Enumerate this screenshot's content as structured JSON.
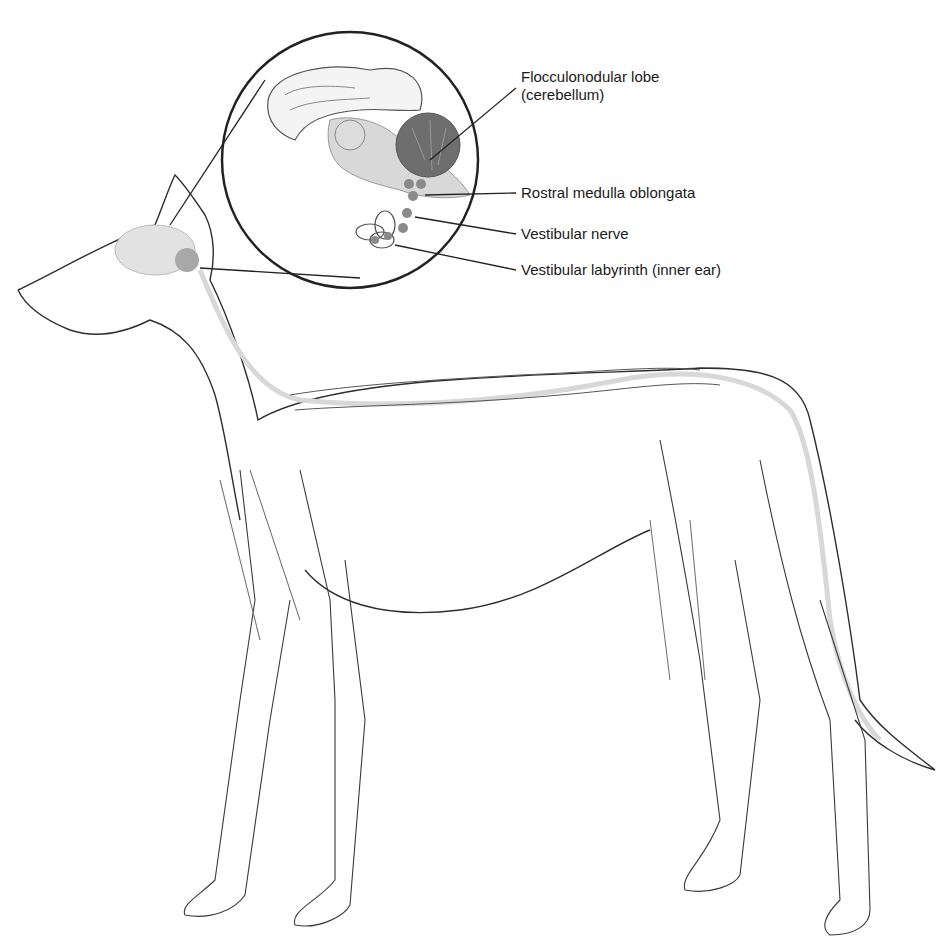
{
  "figure": {
    "inset": {
      "shape": "circle",
      "content": "brain-sagittal-section-with-inner-ear"
    },
    "colors": {
      "outline": "#2a2a2a",
      "nervous_tissue": "#d6d6d6",
      "highlight": "#8a8a8a",
      "cerebellum": "#707070"
    }
  },
  "labels": [
    {
      "id": "flocculonodular",
      "line1": "Flocculonodular lobe",
      "line2": "(cerebellum)"
    },
    {
      "id": "rostral-medulla",
      "line1": "Rostral medulla oblongata"
    },
    {
      "id": "vestibular-nerve",
      "line1": "Vestibular nerve"
    },
    {
      "id": "vestibular-labyrinth",
      "line1": "Vestibular labyrinth (inner ear)"
    }
  ]
}
